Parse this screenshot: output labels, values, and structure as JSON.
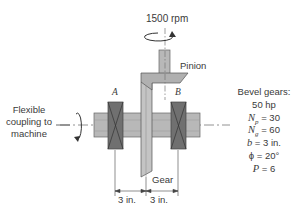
{
  "diagram": {
    "speed_label": "1500 rpm",
    "pinion_label": "Pinion",
    "gear_label": "Gear",
    "bearing_a_label": "A",
    "bearing_b_label": "B",
    "coupling_label_lines": [
      "Flexible",
      "coupling to",
      "machine"
    ],
    "dimensions": [
      "3 in.",
      "3 in."
    ],
    "specs": {
      "title": "Bevel gears:",
      "power": "50 hp",
      "np": {
        "sym": "N",
        "sub": "p",
        "val": " = 30"
      },
      "ng": {
        "sym": "N",
        "sub": "g",
        "val": " = 60"
      },
      "b": {
        "sym": "b",
        "val": " = 3 in."
      },
      "phi": "ϕ = 20°",
      "P": {
        "sym": "P",
        "val": " = 6"
      }
    },
    "colors": {
      "shaft": "#b8b8b8",
      "bearing": "#6e6e6e",
      "gear": "#c4c4c4",
      "outline": "#555555"
    }
  }
}
